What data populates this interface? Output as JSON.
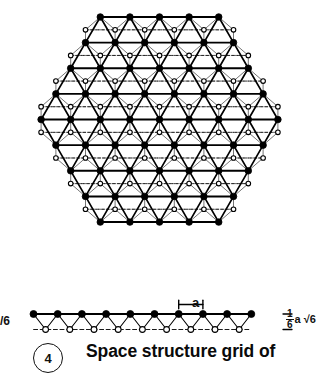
{
  "figure": {
    "number": "4",
    "caption": "Space structure grid of",
    "colors": {
      "ink": "#000000",
      "paper": "#ffffff",
      "node_fill_top": "#000000",
      "node_fill_bottom": "#ffffff"
    }
  },
  "plan_view": {
    "name": "hexagonal double-layer space frame plan",
    "shape": "hexagon",
    "top_chord_rows": [
      5,
      6,
      7,
      8,
      9,
      8,
      7,
      6,
      5
    ],
    "row_count": 9,
    "module_edge_count": 4,
    "bottom_chord_style": "hollow circles on dashed lines",
    "top_chord_style": "filled circles on solid lines"
  },
  "section_view": {
    "name": "elevation / section through grid",
    "top_chord_nodes": 10,
    "bottom_chord_nodes": 9,
    "top_chord_style": "filled circles",
    "bottom_chord_style": "hollow circles on dashed centre line"
  },
  "annotations": {
    "module_label": "a",
    "module_description": "module width between adjacent top chord nodes",
    "depth_numerator": "1",
    "depth_denominator": "6",
    "depth_suffix": "a √6",
    "left_edge_cut_label": "/6"
  },
  "chart_data": {
    "type": "diagram",
    "title": "Space structure grid of",
    "plan_rows": [
      5,
      6,
      7,
      8,
      9,
      8,
      7,
      6,
      5
    ],
    "section_top_nodes": 10,
    "section_bottom_nodes": 9,
    "dimensions": [
      "a",
      "1/6 a √6"
    ]
  }
}
